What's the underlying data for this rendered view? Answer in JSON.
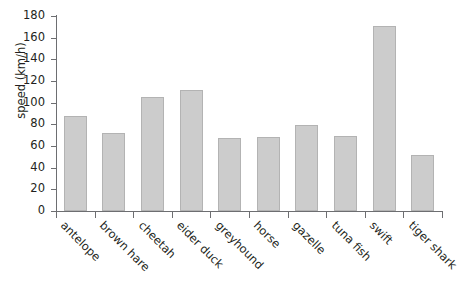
{
  "chart_data": {
    "type": "bar",
    "title": "",
    "xlabel": "",
    "ylabel": "speed (km/h)",
    "categories": [
      "antelope",
      "brown hare",
      "cheetah",
      "eider duck",
      "greyhound",
      "horse",
      "gazelle",
      "tuna fish",
      "swift",
      "tiger shark"
    ],
    "values": [
      88,
      72,
      105,
      112,
      67,
      68,
      79,
      69,
      171,
      52
    ],
    "ylim": [
      0,
      180
    ],
    "ytick_labels": [
      "0",
      "20",
      "40",
      "60",
      "80",
      "100",
      "120",
      "140",
      "160",
      "180"
    ],
    "ytick_values": [
      0,
      20,
      40,
      60,
      80,
      100,
      120,
      140,
      160,
      180
    ],
    "grid": false,
    "legend": null,
    "legend_position": "none",
    "bar_fill_color": "#cccccc",
    "bar_edge_color": "#b3b3b3",
    "axis_color": "#6d6e71",
    "text_color": "#231f20"
  }
}
